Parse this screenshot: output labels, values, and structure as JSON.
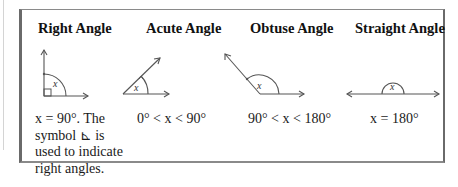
{
  "figure": {
    "angles": [
      {
        "title": "Right Angle",
        "variable": "x",
        "description_lines": [
          "x = 90°. The",
          "symbol ⊾ is",
          "used to indicate",
          "right angles."
        ]
      },
      {
        "title": "Acute Angle",
        "variable": "x",
        "description_lines": [
          "0° < x < 90°"
        ]
      },
      {
        "title": "Obtuse Angle",
        "variable": "x",
        "description_lines": [
          "90° < x < 180°"
        ]
      },
      {
        "title": "Straight Angle",
        "variable": "x",
        "description_lines": [
          "x = 180°"
        ]
      }
    ],
    "right_angle_symbol": "∟"
  }
}
